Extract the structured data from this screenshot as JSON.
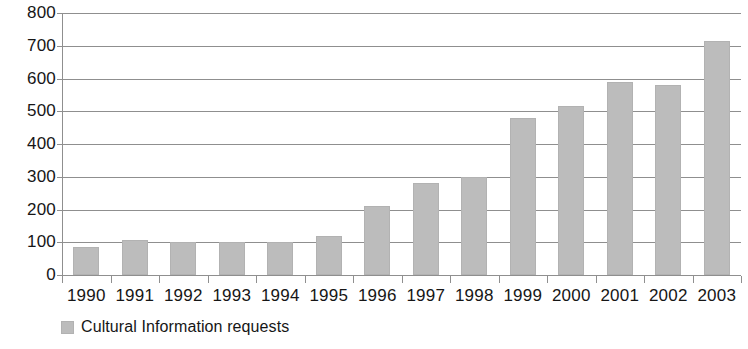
{
  "chart_data": {
    "type": "bar",
    "title": "",
    "subtitle": "",
    "xlabel": "",
    "ylabel": "",
    "categories": [
      "1990",
      "1991",
      "1992",
      "1993",
      "1994",
      "1995",
      "1996",
      "1997",
      "1998",
      "1999",
      "2000",
      "2001",
      "2002",
      "2003"
    ],
    "series": [
      {
        "name": "Cultural Information requests",
        "color": "#bcbcbc",
        "values": [
          85,
          108,
          102,
          101,
          100,
          120,
          210,
          280,
          298,
          480,
          515,
          590,
          580,
          715
        ]
      }
    ],
    "values": [
      85,
      108,
      102,
      101,
      100,
      120,
      210,
      280,
      298,
      480,
      515,
      590,
      580,
      715
    ],
    "ylim": [
      0,
      800
    ],
    "ytick_step": 100,
    "yticks": [
      "800",
      "700",
      "600",
      "500",
      "400",
      "300",
      "200",
      "100",
      "0"
    ],
    "ytick_values": [
      800,
      700,
      600,
      500,
      400,
      300,
      200,
      100,
      0
    ],
    "grid": true,
    "grid_axis": "y",
    "legend": {
      "position": "bottom-left",
      "entries": [
        {
          "label": "Cultural Information requests",
          "color": "#bcbcbc"
        }
      ]
    },
    "colors": {
      "bar_fill": "#bcbcbc",
      "bar_stroke": "#b2b2b2",
      "grid": "#8f8f8f",
      "axis": "#8f8f8f",
      "text": "#161616",
      "background": "#ffffff"
    }
  }
}
